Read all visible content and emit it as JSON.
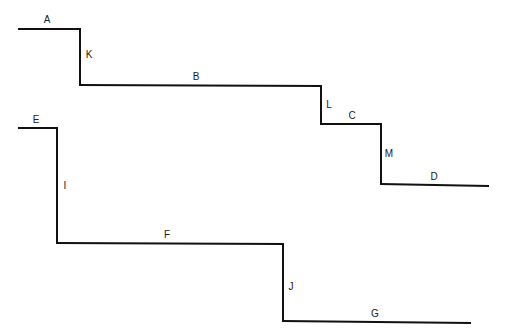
{
  "diagram": {
    "type": "stepped-line-profiles",
    "stroke_color": "#111111",
    "background": "#ffffff",
    "upper_profile": {
      "segments": [
        {
          "label": "A",
          "orientation": "horizontal",
          "from": [
            19,
            29
          ],
          "to": [
            80,
            29
          ],
          "label_pos": [
            47,
            23
          ]
        },
        {
          "label": "K",
          "orientation": "vertical",
          "from": [
            80,
            29
          ],
          "to": [
            80,
            85
          ],
          "label_pos": [
            89,
            58
          ]
        },
        {
          "label": "B",
          "orientation": "horizontal",
          "from": [
            80,
            85
          ],
          "to": [
            321,
            86
          ],
          "label_pos": [
            196,
            80
          ]
        },
        {
          "label": "L",
          "orientation": "vertical",
          "from": [
            321,
            86
          ],
          "to": [
            321,
            124
          ],
          "label_pos": [
            329,
            108
          ]
        },
        {
          "label": "C",
          "orientation": "horizontal",
          "from": [
            321,
            124
          ],
          "to": [
            381,
            124
          ],
          "label_pos": [
            352,
            119
          ]
        },
        {
          "label": "M",
          "orientation": "vertical",
          "from": [
            381,
            124
          ],
          "to": [
            381,
            184
          ],
          "label_pos": [
            389,
            157
          ]
        },
        {
          "label": "D",
          "orientation": "horizontal",
          "from": [
            381,
            184
          ],
          "to": [
            488,
            186
          ],
          "label_pos": [
            434,
            180
          ]
        }
      ]
    },
    "lower_profile": {
      "segments": [
        {
          "label": "E",
          "orientation": "horizontal",
          "from": [
            19,
            128
          ],
          "to": [
            57,
            128
          ],
          "label_pos": [
            36,
            123
          ]
        },
        {
          "label": "I",
          "orientation": "vertical",
          "from": [
            57,
            128
          ],
          "to": [
            57,
            243
          ],
          "label_pos": [
            65,
            189
          ]
        },
        {
          "label": "F",
          "orientation": "horizontal",
          "from": [
            57,
            243
          ],
          "to": [
            283,
            244
          ],
          "label_pos": [
            167,
            238
          ]
        },
        {
          "label": "J",
          "orientation": "vertical",
          "from": [
            283,
            244
          ],
          "to": [
            283,
            321
          ],
          "label_pos": [
            291,
            290
          ]
        },
        {
          "label": "G",
          "orientation": "horizontal",
          "from": [
            283,
            321
          ],
          "to": [
            470,
            323
          ],
          "label_pos": [
            375,
            317
          ]
        }
      ]
    }
  }
}
